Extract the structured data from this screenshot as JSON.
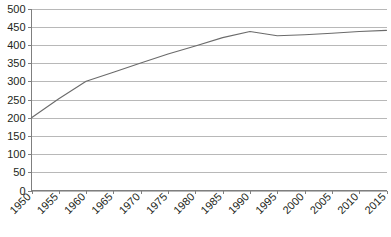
{
  "chart_data": {
    "type": "line",
    "title": "",
    "subtitle": "",
    "xlabel": "",
    "ylabel": "",
    "grid": true,
    "legend": false,
    "legend_position": "none",
    "xlim": [
      1950,
      2015
    ],
    "ylim": [
      0,
      500
    ],
    "ytick_step": 50,
    "xtick_step": 5,
    "line_color": "#6b6b6b",
    "grid_color": "#a6a6a6",
    "axis_color": "#7f7f7f",
    "background_color": "#ffffff",
    "categories": [
      "1950",
      "1955",
      "1960",
      "1965",
      "1970",
      "1975",
      "1980",
      "1985",
      "1990",
      "1995",
      "2000",
      "2005",
      "2010",
      "2015"
    ],
    "x": [
      1950,
      1955,
      1960,
      1965,
      1970,
      1975,
      1980,
      1985,
      1990,
      1995,
      2000,
      2005,
      2010,
      2015
    ],
    "values": [
      200,
      252,
      300,
      325,
      350,
      375,
      397,
      420,
      437,
      425,
      428,
      432,
      437,
      440
    ],
    "series": [
      {
        "name": "series-1",
        "values": [
          200,
          252,
          300,
          325,
          350,
          375,
          397,
          420,
          437,
          425,
          428,
          432,
          437,
          440
        ]
      }
    ],
    "yticks": [
      0,
      50,
      100,
      150,
      200,
      250,
      300,
      350,
      400,
      450,
      500
    ],
    "ytick_labels": [
      "0",
      "50",
      "100",
      "150",
      "200",
      "250",
      "300",
      "350",
      "400",
      "450",
      "500"
    ],
    "xtick_labels": [
      "1950",
      "1955",
      "1960",
      "1965",
      "1970",
      "1975",
      "1980",
      "1985",
      "1990",
      "1995",
      "2000",
      "2005",
      "2010",
      "2015"
    ],
    "annotations": []
  }
}
